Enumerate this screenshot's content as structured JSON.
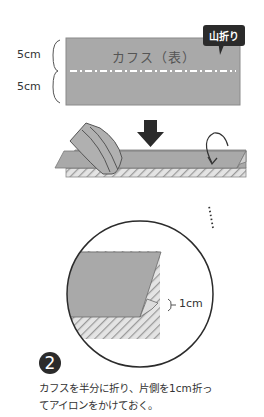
{
  "top_diagram": {
    "cuff_label": "カフス（表）",
    "callout_label": "山折り",
    "dim_upper": "5cm",
    "dim_lower": "5cm"
  },
  "zoom_diagram": {
    "fold_dim": "1cm"
  },
  "step": {
    "number": "2",
    "caption_line1": "カフスを半分に折り、片側を1cm折っ",
    "caption_line2": "てアイロンをかけておく。"
  },
  "colors": {
    "fabric": "#a9a9a9",
    "fabric_edge": "#7a7a7a",
    "hatch": "#c8c8c8",
    "dark": "#2b2b2b",
    "dashed_line": "#ffffff"
  }
}
